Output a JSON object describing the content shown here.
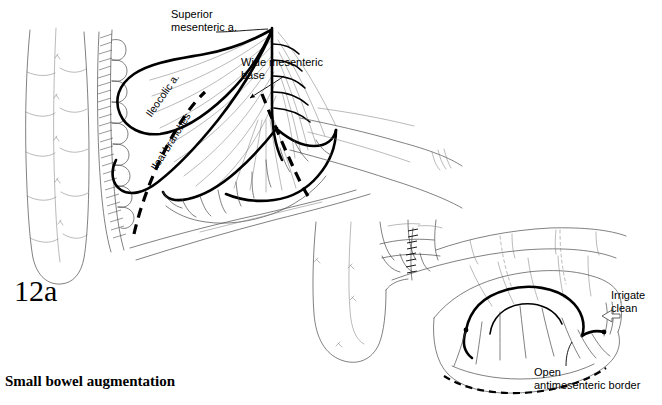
{
  "figure": {
    "number": "12a",
    "caption": "Small bowel augmentation",
    "background_color": "#ffffff",
    "ink_color": "#000000",
    "light_ink_color": "#555555"
  },
  "annotations": {
    "superior_mesenteric": "Superior\nmesenteric a.",
    "wide_mesenteric_base": "Wide mesenteric\nbase",
    "ileocolic": "Ileocolic a.",
    "ileal_branches": "Ileal branches",
    "irrigate_clean": "Irrigate\nclean",
    "open_antimesenteric_border": "Open\nantimesenteric border"
  },
  "panels": [
    {
      "id": "panel-upper-left",
      "name": "mesentery-vascular-anatomy",
      "description": "Ileum loop with mesentery, ileocolic artery and ileal branches arising from superior mesenteric artery; dashed line marks planned division preserving a wide mesenteric base."
    },
    {
      "id": "panel-lower-right",
      "name": "isolated-opened-bowel-segment",
      "description": "Isolated ileal segment on its vascular pedicle, opened along the antimesenteric border and irrigated clean."
    }
  ]
}
